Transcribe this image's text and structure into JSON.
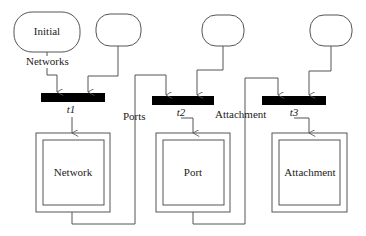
{
  "diagram": {
    "places": [
      {
        "id": "initial",
        "label": "Initial"
      },
      {
        "id": "place-2",
        "label": ""
      },
      {
        "id": "place-3",
        "label": ""
      },
      {
        "id": "place-4",
        "label": ""
      }
    ],
    "transitions": [
      {
        "id": "t1",
        "label": "t1"
      },
      {
        "id": "t2",
        "label": "t2"
      },
      {
        "id": "t3",
        "label": "t3"
      }
    ],
    "arc_labels": {
      "networks": "Networks",
      "ports": "Ports",
      "attachment": "Attachment"
    },
    "modules": [
      {
        "id": "network",
        "label": "Network"
      },
      {
        "id": "port",
        "label": "Port"
      },
      {
        "id": "attachment",
        "label": "Attachment"
      }
    ],
    "colors": {
      "line": "#555555",
      "transition_fill": "#000000",
      "background": "#ffffff"
    }
  }
}
